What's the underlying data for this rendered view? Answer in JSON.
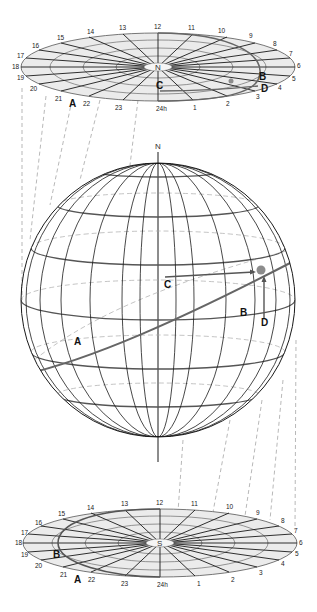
{
  "diagram": {
    "top_disk": {
      "pole_label": "N",
      "hour_labels": [
        "24h",
        "1",
        "2",
        "3",
        "4",
        "5",
        "6",
        "7",
        "8",
        "9",
        "10",
        "11",
        "12",
        "13",
        "14",
        "15",
        "16",
        "17",
        "18",
        "19",
        "20",
        "21",
        "22",
        "23"
      ],
      "path_labels": {
        "A": "A",
        "B": "B",
        "C": "C",
        "D": "D"
      }
    },
    "sphere": {
      "pole_label": "N",
      "path_labels": {
        "A": "A",
        "B": "B",
        "C": "C",
        "D": "D"
      }
    },
    "bottom_disk": {
      "pole_label": "S",
      "hour_labels": [
        "24h",
        "1",
        "2",
        "3",
        "4",
        "5",
        "6",
        "7",
        "8",
        "9",
        "10",
        "11",
        "12",
        "13",
        "14",
        "15",
        "16",
        "17",
        "18",
        "19",
        "20",
        "21",
        "22",
        "23"
      ],
      "path_labels": {
        "A": "A",
        "B": "B"
      }
    },
    "colors": {
      "line": "#1a1a1a",
      "path_gray": "#666666",
      "disk_fill": "#ebebeb",
      "dashed": "#9a9a9a",
      "star": "#8c8c8c"
    }
  }
}
